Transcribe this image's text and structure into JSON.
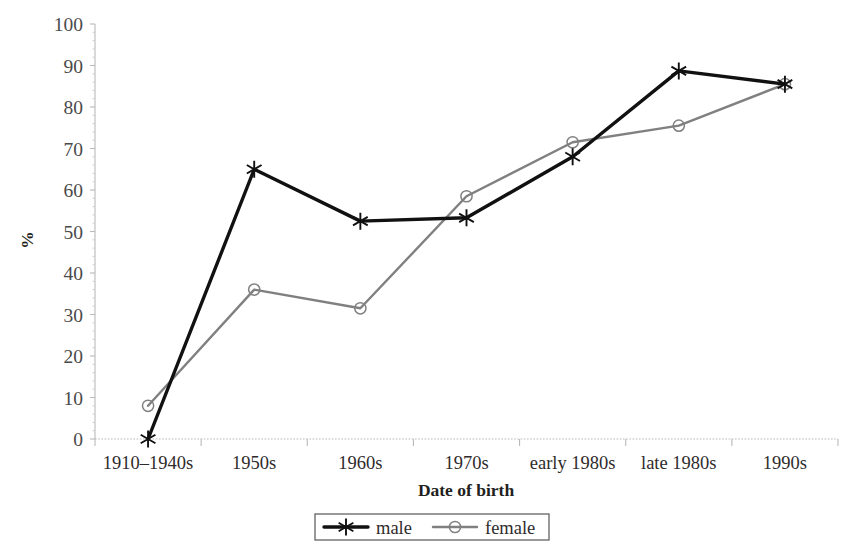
{
  "chart_data": {
    "type": "line",
    "title": "",
    "subtitle": "",
    "xlabel": "Date of birth",
    "ylabel": "%",
    "categories": [
      "1910–1940s",
      "1950s",
      "1960s",
      "1970s",
      "early 1980s",
      "late 1980s",
      "1990s"
    ],
    "series": [
      {
        "name": "male",
        "color": "#111111",
        "marker": "asterisk",
        "line_width": 3.4,
        "values": [
          0,
          65,
          52.5,
          53.3,
          68,
          88.7,
          85.5
        ]
      },
      {
        "name": "female",
        "color": "#808080",
        "marker": "open-circle",
        "line_width": 2.4,
        "values": [
          8,
          36,
          31.5,
          58.5,
          71.5,
          75.5,
          85.5
        ]
      }
    ],
    "ylim": [
      0,
      100
    ],
    "ytick_step": 10,
    "ytick_labels": [
      "0",
      "10",
      "20",
      "30",
      "40",
      "50",
      "60",
      "70",
      "80",
      "90",
      "100"
    ],
    "grid": false,
    "legend_position": "bottom",
    "legend_entries": [
      "male",
      "female"
    ],
    "axis_color": "#b9b9b9",
    "background": "#ffffff"
  },
  "plot": {
    "left": 95,
    "right": 838,
    "top": 24,
    "bottom": 439
  }
}
